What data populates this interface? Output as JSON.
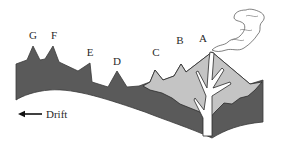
{
  "diagram": {
    "colors": {
      "background": "#ffffff",
      "oceanic_crust": "#5a5a5a",
      "magma_body": "#c4c4c4",
      "outline": "#3a3a3a",
      "conduit": "#ffffff",
      "plume": "#ffffff"
    },
    "islands": [
      {
        "id": "G",
        "label": "G",
        "x": 33,
        "y": 36
      },
      {
        "id": "F",
        "label": "F",
        "x": 53,
        "y": 36
      },
      {
        "id": "E",
        "label": "E",
        "x": 90,
        "y": 52
      },
      {
        "id": "D",
        "label": "D",
        "x": 117,
        "y": 60
      },
      {
        "id": "C",
        "label": "C",
        "x": 156,
        "y": 52
      },
      {
        "id": "B",
        "label": "B",
        "x": 180,
        "y": 40
      },
      {
        "id": "A",
        "label": "A",
        "x": 204,
        "y": 36
      }
    ],
    "drift": {
      "label": "Drift",
      "direction": "left-arrow-icon"
    },
    "features": {
      "volcano": "active-volcano-A",
      "plume": "smoke-plume-icon",
      "conduit": "magma-conduit"
    }
  }
}
